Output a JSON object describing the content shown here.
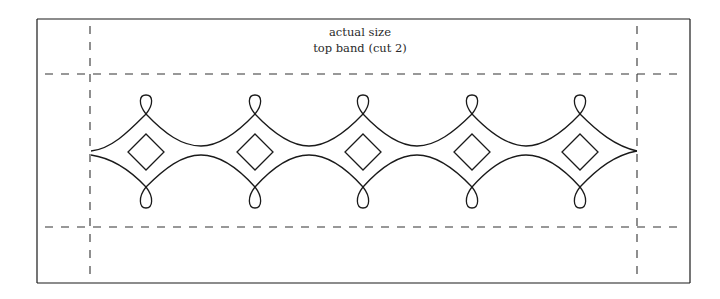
{
  "caption": {
    "line1": "actual size",
    "line2": "top band (cut 2)"
  },
  "pattern": {
    "border": {
      "x": 37,
      "y": 19,
      "width": 653,
      "height": 264
    },
    "cut_lines": {
      "vertical_x": [
        90,
        637
      ],
      "horizontal_y": [
        74,
        227
      ]
    },
    "motif_count": 5,
    "motif_centers_x": [
      146,
      255,
      363,
      472,
      580
    ],
    "colors": {
      "line": "#1a1a1a",
      "dash": "#333333",
      "background": "#ffffff"
    }
  }
}
